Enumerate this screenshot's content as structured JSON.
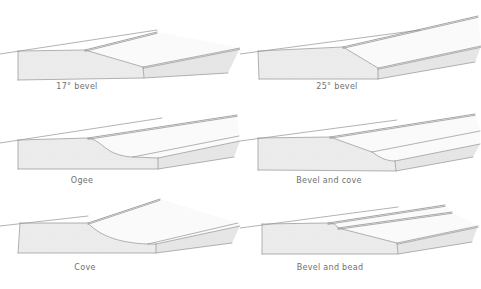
{
  "panels": [
    {
      "id": "bevel-17",
      "label": "17° bevel"
    },
    {
      "id": "bevel-25",
      "label": "25° bevel"
    },
    {
      "id": "ogee",
      "label": "Ogee"
    },
    {
      "id": "bevel-and-cove",
      "label": "Bevel and cove"
    },
    {
      "id": "cove",
      "label": "Cove"
    },
    {
      "id": "bevel-and-bead",
      "label": "Bevel and bead"
    }
  ],
  "colors": {
    "background": "#ffffff",
    "line": "#9a9a9a",
    "line_dark": "#898989",
    "face_fill": "#ececec",
    "front_fill": "#e6e6e6",
    "band_fill": "#fafafa",
    "top_fill": "#ffffff",
    "texture_dot": "#d9d9d9",
    "label_text": "#6f6f6f"
  }
}
